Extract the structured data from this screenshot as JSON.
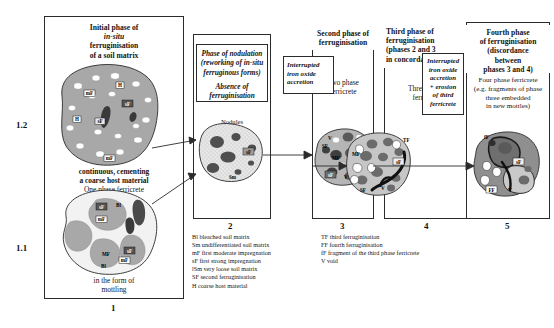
{
  "figure": {
    "panels": [
      {
        "number": "1",
        "header_lines": [
          "Initial phase of",
          "in-situ",
          "ferruginisation",
          "of a soil matrix"
        ],
        "sub_number_upper": "1.2",
        "sub_number_lower": "1.1",
        "caption_upper_bold": [
          "continuous, cementing",
          "a coarse host material"
        ],
        "caption_upper_plain": [
          "One phase ferricrete"
        ],
        "caption_lower": [
          "in the form of",
          "mottling"
        ],
        "shape_labels_upper": [
          "mF",
          "H",
          "sF",
          "H",
          "sF",
          "mF"
        ],
        "shape_labels_lower": [
          "sF",
          "Bl",
          "mF",
          "MF",
          "sF",
          "mF",
          "Bl"
        ]
      },
      {
        "number": "2",
        "sub_box_lines": [
          "Phase of nodulation",
          "(reworking of in-situ",
          "ferruginous forms)",
          "",
          "Absence of",
          "ferruginisation"
        ],
        "diagram_top_label": "Nodules",
        "shape_labels": [
          "sF",
          "Sm"
        ]
      },
      {
        "number": "3",
        "header_lines": [
          "Second phase of",
          "ferruginisation"
        ],
        "body_lines": [
          "Two phase",
          "ferricrete"
        ],
        "shape_labels": [
          "V",
          "SF",
          "MF",
          "sF",
          "V"
        ]
      },
      {
        "number": "4",
        "header_lines": [
          "Third phase of",
          "ferruginisation",
          "(phases 2 and 3",
          "in concordance)"
        ],
        "body_lines": [
          "Three phase",
          "ferricrete"
        ],
        "interrupt_box_lines": [
          "Interrupted",
          "iron oxide",
          "accretion"
        ],
        "shape_labels": [
          "TF",
          "MF",
          "sF",
          "SF",
          "V"
        ]
      },
      {
        "number": "5",
        "header_lines": [
          "Fourth phase",
          "of  ferruginisation",
          "(discordance",
          "between",
          "phases 3 and 4)"
        ],
        "body_lines": [
          "Four phase ferricrete",
          "(e.g. fragments of phase",
          "three embedded",
          "in new mottles)"
        ],
        "interrupt_box_lines": [
          "Interrupted",
          "iron oxide",
          "accretion",
          "+ erosion",
          "of third",
          "ferricrete"
        ],
        "shape_labels": [
          "fF",
          "sF",
          "FF",
          "V"
        ]
      }
    ],
    "legend_left": [
      "Bl bleached soil matrix",
      "Sm undifferentiated soil matrix",
      "mF first moderate impregnation",
      "sF first strong impregnation",
      "lSm very loose soil matrix",
      "SF second ferruginisation",
      "H coarse host material"
    ],
    "legend_right": [
      "TF third ferruginisation",
      "FF fourth ferruginisation",
      "fF fragment of the third  phase ferricrete",
      "V void"
    ],
    "colors": {
      "matrix_gray": "#a8a8a8",
      "dark_gray": "#4f4f4f",
      "light_stipple": "#e2e2e2",
      "outline": "#2b2b2b",
      "white": "#ffffff"
    }
  }
}
